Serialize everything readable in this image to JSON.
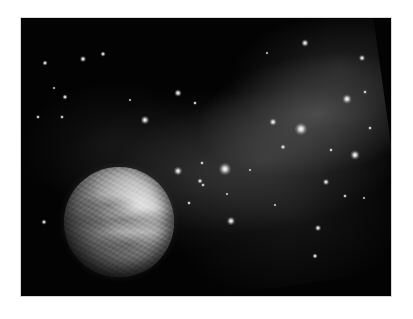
{
  "image": {
    "subject": "Planet in deep space with stars and a diagonal nebula band",
    "palette": {
      "page_background": "#ffffff",
      "space": "#030303",
      "nebula": "#6e6e6e",
      "star": "#ffffff",
      "planet_light": "#cfcfcf",
      "planet_dark": "#141414"
    },
    "frame": {
      "x": 21,
      "y": 18,
      "width": 370,
      "height": 278
    },
    "planet": {
      "cx": 119,
      "cy": 222,
      "radius": 55,
      "lit_side": "upper-right"
    },
    "stars": [
      {
        "x": 301,
        "y": 129,
        "size": 12
      },
      {
        "x": 225,
        "y": 169,
        "size": 12
      },
      {
        "x": 355,
        "y": 155,
        "size": 9
      },
      {
        "x": 347,
        "y": 99,
        "size": 9
      },
      {
        "x": 273,
        "y": 122,
        "size": 7
      },
      {
        "x": 145,
        "y": 120,
        "size": 8
      },
      {
        "x": 178,
        "y": 93,
        "size": 7
      },
      {
        "x": 305,
        "y": 43,
        "size": 7
      },
      {
        "x": 362,
        "y": 58,
        "size": 6
      },
      {
        "x": 83,
        "y": 59,
        "size": 6
      },
      {
        "x": 103,
        "y": 54,
        "size": 5
      },
      {
        "x": 45,
        "y": 63,
        "size": 5
      },
      {
        "x": 65,
        "y": 97,
        "size": 5
      },
      {
        "x": 54,
        "y": 88,
        "size": 3
      },
      {
        "x": 38,
        "y": 117,
        "size": 4
      },
      {
        "x": 62,
        "y": 117,
        "size": 4
      },
      {
        "x": 195,
        "y": 103,
        "size": 4
      },
      {
        "x": 267,
        "y": 53,
        "size": 3
      },
      {
        "x": 365,
        "y": 92,
        "size": 4
      },
      {
        "x": 178,
        "y": 171,
        "size": 8
      },
      {
        "x": 200,
        "y": 181,
        "size": 5
      },
      {
        "x": 202,
        "y": 163,
        "size": 4
      },
      {
        "x": 189,
        "y": 203,
        "size": 4
      },
      {
        "x": 231,
        "y": 221,
        "size": 8
      },
      {
        "x": 318,
        "y": 228,
        "size": 6
      },
      {
        "x": 315,
        "y": 256,
        "size": 5
      },
      {
        "x": 203,
        "y": 185,
        "size": 4
      },
      {
        "x": 227,
        "y": 194,
        "size": 3
      },
      {
        "x": 345,
        "y": 196,
        "size": 4
      },
      {
        "x": 364,
        "y": 198,
        "size": 3
      },
      {
        "x": 326,
        "y": 182,
        "size": 6
      },
      {
        "x": 283,
        "y": 147,
        "size": 5
      },
      {
        "x": 331,
        "y": 150,
        "size": 4
      },
      {
        "x": 44,
        "y": 222,
        "size": 5
      },
      {
        "x": 250,
        "y": 170,
        "size": 3
      },
      {
        "x": 275,
        "y": 205,
        "size": 3
      },
      {
        "x": 370,
        "y": 128,
        "size": 4
      },
      {
        "x": 130,
        "y": 100,
        "size": 3
      }
    ]
  }
}
